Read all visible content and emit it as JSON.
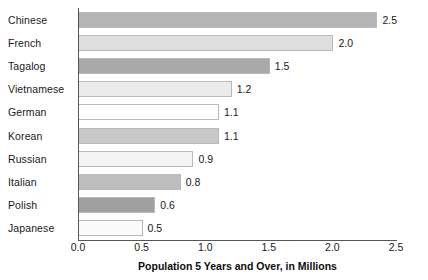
{
  "chart_data": {
    "type": "bar",
    "orientation": "horizontal",
    "title": "",
    "xlabel": "Population 5 Years and Over, in Millions",
    "ylabel": "",
    "xlim": [
      0.0,
      2.5
    ],
    "grid": false,
    "legend": null,
    "categories": [
      "Chinese",
      "French",
      "Tagalog",
      "Vietnamese",
      "German",
      "Korean",
      "Russian",
      "Italian",
      "Polish",
      "Japanese"
    ],
    "values": [
      2.5,
      2.0,
      1.5,
      1.2,
      1.1,
      1.1,
      0.9,
      0.8,
      0.6,
      0.5
    ],
    "value_labels": [
      "2.5",
      "2.0",
      "1.5",
      "1.2",
      "1.1",
      "1.1",
      "0.9",
      "0.8",
      "0.6",
      "0.5"
    ],
    "bar_colors": [
      "#b4b4b4",
      "#dedede",
      "#a8a8a8",
      "#ebebeb",
      "#ffffff",
      "#c9c9c9",
      "#f4f4f4",
      "#bdbdbd",
      "#a0a0a0",
      "#fafafa"
    ],
    "xticks": [
      0.0,
      0.5,
      1.0,
      1.5,
      2.0,
      2.5
    ],
    "xtick_labels": [
      "0.0",
      "0.5",
      "1.0",
      "1.5",
      "2.0",
      "2.5"
    ],
    "axis_color": "#555555",
    "bar_border_color": "#b9b9b9",
    "text_color": "#1a1a1a"
  }
}
